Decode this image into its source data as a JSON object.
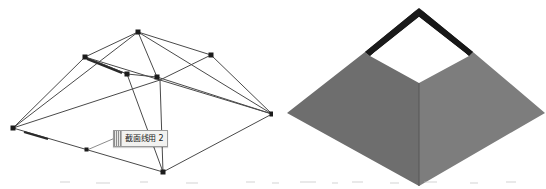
{
  "figure": {
    "title": "",
    "background_color": "#ffffff",
    "width": 546,
    "height": 189,
    "panels": [
      {
        "id": "wireframe",
        "name": "wireframe-model-view",
        "caption": ""
      },
      {
        "id": "solid",
        "name": "shaded-solid-model-view",
        "caption": ""
      }
    ]
  },
  "wireframe": {
    "stroke_color": "#4a4a4a",
    "vertex_color": "#1c1c1c",
    "outer_quad": [
      {
        "name": "outer-left",
        "x": 13,
        "y": 128
      },
      {
        "name": "outer-top",
        "x": 138,
        "y": 32
      },
      {
        "name": "outer-right",
        "x": 272,
        "y": 114
      },
      {
        "name": "outer-bottom",
        "x": 163,
        "y": 172
      }
    ],
    "inner_quad": [
      {
        "name": "inner-left",
        "x": 85,
        "y": 57
      },
      {
        "name": "inner-top",
        "x": 138,
        "y": 32
      },
      {
        "name": "inner-right",
        "x": 211,
        "y": 55
      },
      {
        "name": "inner-bottom",
        "x": 160,
        "y": 80
      }
    ],
    "ridge_points": [
      {
        "name": "ridge-mid-left",
        "x": 127,
        "y": 74
      },
      {
        "name": "ridge-mid-right",
        "x": 157,
        "y": 77
      }
    ],
    "edge_midpoints": [
      {
        "name": "edge-mid-bottom-left",
        "x": 87,
        "y": 150
      }
    ],
    "vertices": [
      {
        "x": 13,
        "y": 128
      },
      {
        "x": 138,
        "y": 32
      },
      {
        "x": 272,
        "y": 114
      },
      {
        "x": 163,
        "y": 172
      },
      {
        "x": 85,
        "y": 57
      },
      {
        "x": 211,
        "y": 55
      },
      {
        "x": 127,
        "y": 74
      },
      {
        "x": 157,
        "y": 77
      },
      {
        "x": 87,
        "y": 150
      }
    ]
  },
  "callout": {
    "label_text": "截面线用 2",
    "grip_name": "drag-grip",
    "anchor_point": {
      "x": 87,
      "y": 150
    },
    "leader_point": {
      "x": 115,
      "y": 138
    },
    "background_color": "#f2f2f0",
    "border_color": "#9a9a9a",
    "text_color": "#1b1b1b"
  },
  "solid": {
    "outline_color": "#1a1a1a",
    "face_colors": {
      "left_slope": "#6e6e6e",
      "right_slope": "#7d7d7d",
      "inner_back_left": "#1a1a1a",
      "inner_back_right": "#171717",
      "hole_opening": "#ffffff",
      "ridge_line": "#575757"
    },
    "geometry": {
      "base_left": {
        "x": 14,
        "y": 113
      },
      "base_top": {
        "x": 146,
        "y": 8
      },
      "base_right": {
        "x": 272,
        "y": 113
      },
      "base_bottom": {
        "x": 146,
        "y": 186
      },
      "top_left": {
        "x": 92,
        "y": 52
      },
      "top_top": {
        "x": 146,
        "y": 8
      },
      "top_right": {
        "x": 200,
        "y": 52
      },
      "top_bottom": {
        "x": 146,
        "y": 83
      },
      "hole_left": {
        "x": 97,
        "y": 56
      },
      "hole_top": {
        "x": 146,
        "y": 17
      },
      "hole_right": {
        "x": 196,
        "y": 56
      },
      "hole_bottom": {
        "x": 146,
        "y": 83
      }
    }
  }
}
